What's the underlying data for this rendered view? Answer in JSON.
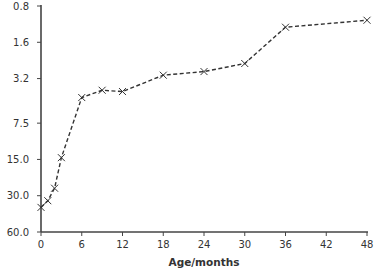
{
  "chart_data": {
    "type": "line",
    "title": "",
    "xlabel": "Age/months",
    "ylabel": "",
    "y_scale": "log",
    "y_inverted": true,
    "xlim": [
      0,
      48
    ],
    "ylim": [
      0.8,
      60.0
    ],
    "x_ticks": [
      "0",
      "6",
      "12",
      "18",
      "24",
      "30",
      "36",
      "42",
      "48"
    ],
    "x_tick_values": [
      0,
      6,
      12,
      18,
      24,
      30,
      36,
      42,
      48
    ],
    "y_ticks": [
      "0.8",
      "1.6",
      "3.2",
      "7.5",
      "15.0",
      "30.0",
      "60.0"
    ],
    "y_tick_values": [
      0.8,
      1.6,
      3.2,
      7.5,
      15.0,
      30.0,
      60.0
    ],
    "grid": false,
    "legend": "none",
    "series": [
      {
        "name": "series-1",
        "marker": "x",
        "line_style": "dashed",
        "color": "#333333",
        "x": [
          0,
          1,
          2,
          3,
          6,
          9,
          12,
          18,
          24,
          30,
          36,
          48
        ],
        "values": [
          37.5,
          33.0,
          26.0,
          14.5,
          4.6,
          4.0,
          4.1,
          3.0,
          2.8,
          2.4,
          1.2,
          1.05
        ]
      }
    ]
  }
}
